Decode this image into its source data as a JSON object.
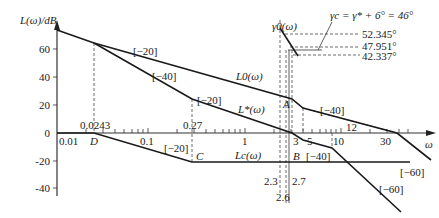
{
  "diagram": {
    "y_axis_label": "L(ω)/dB",
    "x_axis_label": "ω",
    "y_ticks": [
      "60",
      "40",
      "20",
      "0",
      "-20",
      "-40"
    ],
    "x_ticks": [
      "0.01",
      "0.1",
      "1",
      "10"
    ],
    "x_markers": {
      "d_freq": "0.0243",
      "c_freq": "0.27",
      "f3": "3",
      "f5": "5",
      "f12": "12",
      "f30": "30",
      "f23": "2.3",
      "f26": "2.6",
      "f27": "2.7"
    },
    "points": {
      "D": "D",
      "C": "C",
      "A": "A",
      "B": "B"
    },
    "curves": {
      "L0": "L0(ω)",
      "Lstar": "L*(ω)",
      "Lc": "Lc(ω)",
      "gamma0": "γ0(ω)"
    },
    "slopes": {
      "L0_a": "[−20]",
      "Lstar_a": "[−40]",
      "Lstar_b": "[−20]",
      "Lc_a": "[−20]",
      "L0_b": "[−40]",
      "Lc_b": "[−40]",
      "Lc_c": "[−60]",
      "L0_c": "[−60]"
    },
    "annotation": {
      "gamma_c": "γc = γ* + 6° = 46°",
      "phase1": "52.345°",
      "phase2": "47.951°",
      "phase3": "42.337°"
    }
  }
}
